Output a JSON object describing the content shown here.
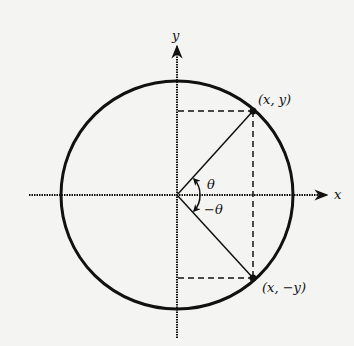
{
  "diagram": {
    "type": "unit-circle-symmetry",
    "colors": {
      "ink": "#111111",
      "background": "#f4f4f2"
    },
    "axes": {
      "x_label": "x",
      "y_label": "y"
    },
    "points": [
      {
        "id": "p1",
        "label": "(x, y)"
      },
      {
        "id": "p2",
        "label": "(x, −y)"
      }
    ],
    "angles": [
      {
        "id": "a1",
        "label": "θ"
      },
      {
        "id": "a2",
        "label": "−θ"
      }
    ]
  }
}
